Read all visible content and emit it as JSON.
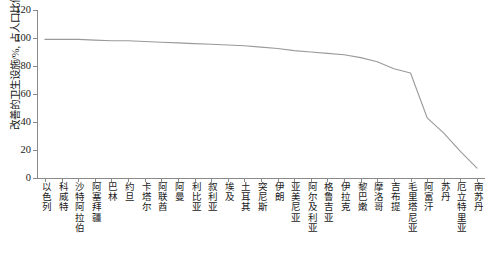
{
  "chart_data": {
    "type": "line",
    "title": "",
    "xlabel": "",
    "ylabel": "改善的卫生设施/%, 占人口比例)",
    "ylim": [
      0,
      120
    ],
    "yticks": [
      0,
      20,
      40,
      60,
      80,
      100,
      120
    ],
    "grid": false,
    "legend": "none",
    "series_color": "#9a9a9a",
    "axis_color": "#8a8a8a",
    "categories": [
      "以色列",
      "科威特",
      "沙特阿拉伯",
      "阿塞拜疆",
      "巴林",
      "约旦",
      "卡塔尔",
      "阿联酋",
      "阿曼",
      "利比亚",
      "叙利亚",
      "埃及",
      "土耳其",
      "突尼斯",
      "伊朗",
      "亚美尼亚",
      "阿尔及利亚",
      "格鲁吉亚",
      "伊拉克",
      "黎巴嫩",
      "摩洛哥",
      "吉布提",
      "毛里塔尼亚",
      "阿富汗",
      "苏丹",
      "厄立特里亚",
      "南苏丹"
    ],
    "values": [
      99,
      99,
      99,
      98.5,
      98,
      98,
      97.5,
      97,
      96.5,
      96,
      95.5,
      95,
      94.5,
      93.5,
      92.5,
      91,
      90,
      89,
      88,
      86,
      83,
      78,
      75,
      43,
      32,
      19,
      7
    ]
  }
}
